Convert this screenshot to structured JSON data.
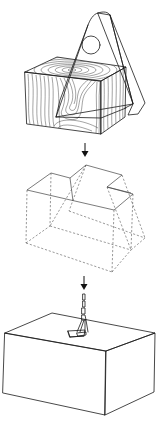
{
  "figure": {
    "stages": [
      {
        "name": "wood-block-with-plate",
        "elements": [
          "wood-grain-block",
          "triangular-plate",
          "circular-hole",
          "hatched-plate-edge"
        ]
      },
      {
        "name": "dashed-wireframe",
        "elements": [
          "stepped-top-outline",
          "hidden-edges-dashed"
        ]
      },
      {
        "name": "hoisted-box",
        "elements": [
          "chain",
          "clamp",
          "large-box"
        ]
      }
    ],
    "arrows": [
      "down-arrow-1",
      "down-arrow-2"
    ],
    "colors": {
      "ink": "#1a1a1a",
      "background": "#ffffff"
    }
  }
}
